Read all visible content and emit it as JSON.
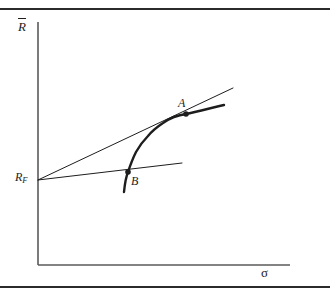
{
  "figure": {
    "kind": "economics-finance-diagram",
    "background_color": "#ffffff",
    "ink_color": "#1d1d1d",
    "rule_color": "#2b2b2b",
    "width": 330,
    "height": 294
  },
  "axes": {
    "y_label": "R",
    "y_label_accent": "overbar",
    "y_label_full": "R̄",
    "x_label": "σ",
    "origin": {
      "x": 38,
      "y": 265
    },
    "y_axis_top": {
      "x": 38,
      "y": 22
    },
    "x_axis_right": {
      "x": 290,
      "y": 265
    },
    "axis_color": "#5a5a5a"
  },
  "intercept": {
    "label": "R",
    "subscript": "F",
    "label_full": "R_F",
    "point": {
      "x": 38,
      "y": 180
    }
  },
  "points": [
    {
      "id": "A",
      "label": "A",
      "x": 186,
      "y": 114,
      "label_x": 178,
      "label_y": 97
    },
    {
      "id": "B",
      "label": "B",
      "x": 128,
      "y": 172,
      "label_x": 131,
      "label_y": 175
    }
  ],
  "curve": {
    "name": "efficient-frontier",
    "stroke_width": 2.4,
    "path_points": [
      {
        "x": 124,
        "y": 192
      },
      {
        "x": 128,
        "y": 172
      },
      {
        "x": 136,
        "y": 152
      },
      {
        "x": 148,
        "y": 136
      },
      {
        "x": 163,
        "y": 123
      },
      {
        "x": 186,
        "y": 114
      },
      {
        "x": 205,
        "y": 108
      },
      {
        "x": 224,
        "y": 105
      }
    ]
  },
  "lines": [
    {
      "name": "tangent-line-to-A",
      "from": {
        "x": 38,
        "y": 180
      },
      "to": {
        "x": 233,
        "y": 88
      },
      "stroke_width": 1.0
    },
    {
      "name": "tangent-line-to-B",
      "from": {
        "x": 38,
        "y": 180
      },
      "to": {
        "x": 182,
        "y": 163
      },
      "stroke_width": 1.0
    }
  ],
  "rules": {
    "top_y": 8,
    "bottom_y": 286
  }
}
